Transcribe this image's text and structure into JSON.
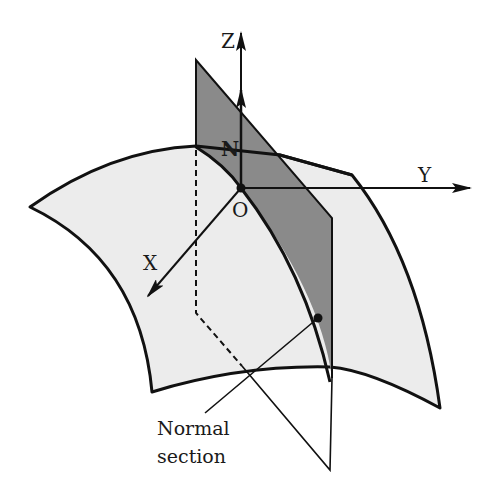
{
  "figure": {
    "type": "geometric diagram",
    "labels": {
      "z_axis": "Z",
      "y_axis": "Y",
      "x_axis": "X",
      "origin": "O",
      "normal_vector": "N",
      "caption_line1": "Normal",
      "caption_line2": "section"
    },
    "colors": {
      "background": "#ffffff",
      "surface_fill": "#ececec",
      "plane_fill": "#8a8a8a",
      "stroke": "#111111"
    }
  }
}
